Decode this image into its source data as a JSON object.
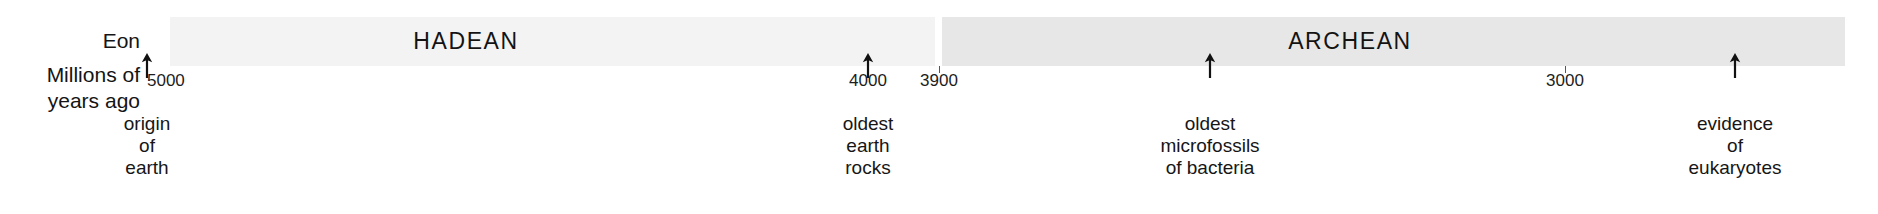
{
  "axis": {
    "row_labels": {
      "eon": "Eon",
      "scale": "Millions of\nyears ago"
    },
    "ticks": [
      {
        "value": "5000",
        "x": 147,
        "align": "left"
      },
      {
        "value": "4000",
        "x": 868,
        "align": "center"
      },
      {
        "value": "3900",
        "x": 939,
        "align": "center"
      },
      {
        "value": "3000",
        "x": 1565,
        "align": "center"
      }
    ]
  },
  "eons": [
    {
      "name": "HADEAN",
      "left": 0,
      "width": 765,
      "color": "#f3f3f3",
      "label_center": 296
    },
    {
      "name": "ARCHEAN",
      "left": 772,
      "width": 903,
      "color": "#e7e7e7",
      "label_center": 408
    }
  ],
  "events": [
    {
      "label": "origin\nof earth",
      "x": 147
    },
    {
      "label": "oldest\nearth\nrocks",
      "x": 868
    },
    {
      "label": "oldest\nmicrofossils\nof bacteria",
      "x": 1210
    },
    {
      "label": "evidence of\neukaryotes",
      "x": 1735
    }
  ],
  "chart_data": {
    "type": "timeline",
    "xlabel": "Millions of years ago",
    "axis_direction": "older-to-younger (left to right)",
    "xlim": [
      5000,
      2800
    ],
    "tick_values": [
      5000,
      4000,
      3900,
      3000
    ],
    "grid": false,
    "legend": "none",
    "bands": [
      {
        "name": "HADEAN",
        "start_mya": 4900,
        "end_mya": 3900
      },
      {
        "name": "ARCHEAN",
        "start_mya": 3900,
        "end_mya": 2720
      }
    ],
    "annotations": [
      {
        "label": "origin of earth",
        "mya": 4950
      },
      {
        "label": "oldest earth rocks",
        "mya": 4000
      },
      {
        "label": "oldest microfossils of bacteria",
        "mya": 3540
      },
      {
        "label": "evidence of eukaryotes",
        "mya": 2840
      }
    ]
  }
}
